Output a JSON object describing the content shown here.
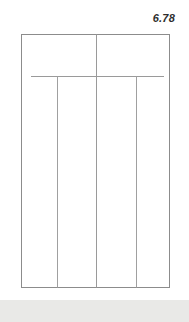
{
  "figure": {
    "label": "6.78",
    "caption": ""
  },
  "colors": {
    "background": "#ffffff",
    "stroke": "#8c8c8c",
    "stroke_light": "#a8a8a8",
    "label_text": "#2e2e2e",
    "bottom_band": "#e9e9e7"
  },
  "drawing": {
    "type": "line-drawing",
    "description": "elevation of a rectangular panel assembly divided into vertical bays",
    "outer_rect": {
      "x": 21,
      "y": 34,
      "width": 149,
      "height": 254
    },
    "horizontal_rail": {
      "y": 76,
      "x1": 31,
      "x2": 164
    },
    "verticals": [
      {
        "name": "center-mullion",
        "x": 96,
        "y1": 34,
        "y2": 288
      },
      {
        "name": "left-mullion",
        "x": 57,
        "y1": 76,
        "y2": 288
      },
      {
        "name": "right-mullion",
        "x": 136,
        "y1": 76,
        "y2": 288
      }
    ],
    "bays": 4
  },
  "bottom_band": {
    "y": 300,
    "height": 22
  }
}
